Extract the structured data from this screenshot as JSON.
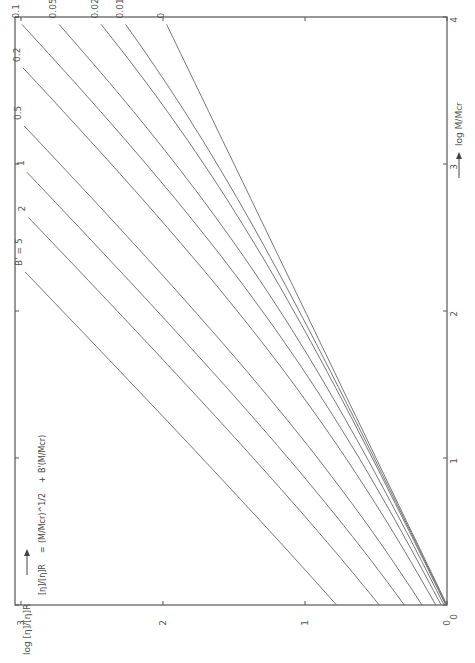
{
  "chart_data": {
    "type": "line",
    "orientation": "rotated-90-ccw",
    "title": "",
    "formula": {
      "lhs": "[η]/[η]R",
      "rhs_term1": "(M/Mcr)^1/2",
      "plus": "+",
      "rhs_term2": "B'(M/Mcr)"
    },
    "xlabel": "log M/Mcr",
    "ylabel": "log [η]/[η]R",
    "xlim": [
      0,
      4
    ],
    "ylim": [
      0,
      3
    ],
    "xticks": [
      "0",
      "1",
      "2",
      "3",
      "4"
    ],
    "yticks": [
      "0",
      "1",
      "2",
      "3"
    ],
    "legend_prefix": "B' = ",
    "series": [
      {
        "name": "5",
        "label": "B' = 5",
        "B": 5,
        "x_end": 2.45
      },
      {
        "name": "2",
        "label": "2",
        "B": 2,
        "x_end": 2.85
      },
      {
        "name": "1",
        "label": "1",
        "B": 1,
        "x_end": 3.1
      },
      {
        "name": "0.5",
        "label": "0.5",
        "B": 0.5,
        "x_end": 3.95
      },
      {
        "name": "0.2",
        "label": "0.2",
        "B": 0.2,
        "x_end": 3.95
      },
      {
        "name": "0.1",
        "label": "0.1",
        "B": 0.1,
        "x_end": 3.95
      },
      {
        "name": "0.05",
        "label": "0.05",
        "B": 0.05,
        "x_end": 3.95
      },
      {
        "name": "0.02",
        "label": "0.02",
        "B": 0.02,
        "x_end": 3.95
      },
      {
        "name": "0.01",
        "label": "0.01",
        "B": 0.01,
        "x_end": 3.95
      },
      {
        "name": "0",
        "label": "0",
        "B": 0,
        "x_end": 3.95
      }
    ],
    "grid": false
  }
}
